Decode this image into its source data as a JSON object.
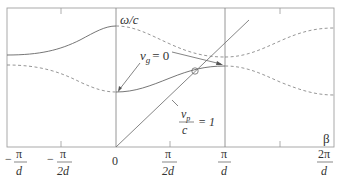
{
  "diagram": {
    "type": "dispersion-diagram",
    "y_axis_label": "ω/c",
    "x_axis_label": "β",
    "x_ticks": [
      {
        "num": "π",
        "den": "d",
        "sign": "−",
        "value": "-π/d"
      },
      {
        "num": "π",
        "den": "2d",
        "sign": "−",
        "value": "-π/2d"
      },
      {
        "num": "0",
        "den": "",
        "sign": "",
        "value": "0"
      },
      {
        "num": "π",
        "den": "2d",
        "sign": "",
        "value": "π/2d"
      },
      {
        "num": "π",
        "den": "d",
        "sign": "",
        "value": "π/d"
      },
      {
        "num": "2π",
        "den": "d",
        "sign": "",
        "value": "2π/d"
      }
    ],
    "annotations": {
      "group_velocity": "v",
      "group_velocity_sub": "g",
      "group_velocity_eq": "= 0",
      "phase_velocity_num": "v",
      "phase_velocity_sub": "p",
      "phase_velocity_den": "c",
      "phase_velocity_eq": "= 1"
    },
    "curves": [
      {
        "name": "passband-1-solid",
        "style": "solid"
      },
      {
        "name": "passband-2-solid",
        "style": "solid"
      },
      {
        "name": "space-harmonic-dashed",
        "style": "dashed"
      },
      {
        "name": "light-line",
        "style": "solid",
        "slope": 1
      }
    ],
    "colors": {
      "line": "#555555",
      "frame": "#9a9a9a",
      "dashed": "#8a8a8a"
    }
  }
}
